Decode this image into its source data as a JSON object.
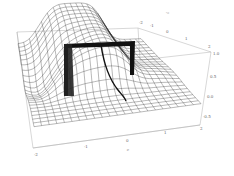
{
  "chart_data": {
    "type": "surface3d",
    "title": "",
    "x_axis": {
      "label": "x",
      "ticks": [
        "-2",
        "-1",
        "0",
        "1",
        "2"
      ],
      "range": [
        -2,
        2
      ]
    },
    "y_axis": {
      "label": "y",
      "ticks": [
        "-2",
        "-1",
        "0",
        "1",
        "2"
      ],
      "range": [
        -2,
        2
      ]
    },
    "z_axis": {
      "label": "",
      "ticks": [
        "-0.5",
        "0.0",
        "0.5",
        "1.0"
      ],
      "range": [
        -0.5,
        1.0
      ]
    },
    "grid": false,
    "box": true,
    "mesh_color": "#333333",
    "box_color": "#b0b0b0",
    "background": "#ffffff"
  },
  "labels": {
    "x_ticks": [
      "-2",
      "-1",
      "0",
      "1",
      "2"
    ],
    "y_ticks": [
      "-2",
      "-1",
      "0",
      "1",
      "2"
    ],
    "z_ticks": [
      "1.0",
      "0.5",
      "0.0",
      "-0.5"
    ],
    "x_label": "x",
    "y_label": "y"
  }
}
